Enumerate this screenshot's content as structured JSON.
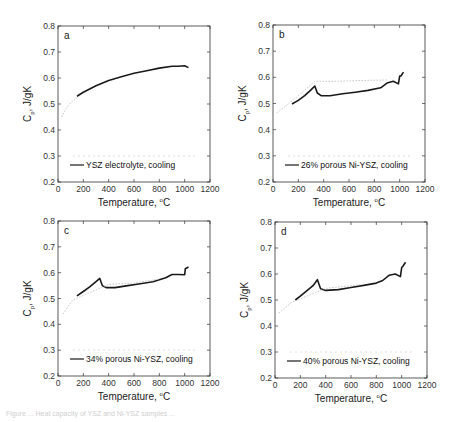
{
  "figure": {
    "caption": "Figure ... Heat capacity of YSZ and Ni-YSZ samples ..."
  },
  "chart_data": [
    {
      "type": "line",
      "panel": "a",
      "title": "",
      "xlabel": "Temperature, °C",
      "ylabel": "Cp, J/gK",
      "xlim": [
        0,
        1200
      ],
      "ylim": [
        0.2,
        0.8
      ],
      "xticks": [
        0,
        200,
        400,
        600,
        800,
        1000,
        1200
      ],
      "yticks": [
        0.2,
        0.3,
        0.4,
        0.5,
        0.6,
        0.7,
        0.8
      ],
      "legend": [
        "YSZ electrolyte, cooling"
      ],
      "legend_position": "lower center",
      "grid": false,
      "series": [
        {
          "name": "YSZ electrolyte, cooling",
          "x": [
            150,
            200,
            300,
            400,
            500,
            600,
            700,
            800,
            900,
            950,
            1000,
            1030
          ],
          "y": [
            0.53,
            0.545,
            0.57,
            0.59,
            0.605,
            0.618,
            0.628,
            0.638,
            0.645,
            0.645,
            0.647,
            0.64
          ]
        },
        {
          "name": "heating (faint)",
          "x": [
            30,
            60,
            100,
            150
          ],
          "y": [
            0.45,
            0.48,
            0.505,
            0.525
          ]
        }
      ]
    },
    {
      "type": "line",
      "panel": "b",
      "xlabel": "Temperature, °C",
      "ylabel": "Cp, J/gK",
      "xlim": [
        0,
        1200
      ],
      "ylim": [
        0.2,
        0.8
      ],
      "xticks": [
        0,
        200,
        400,
        600,
        800,
        1000,
        1200
      ],
      "yticks": [
        0.2,
        0.3,
        0.4,
        0.5,
        0.6,
        0.7,
        0.8
      ],
      "legend": [
        "26% porous Ni-YSZ, cooling"
      ],
      "legend_position": "lower center",
      "grid": false,
      "series": [
        {
          "name": "26% porous Ni-YSZ, cooling",
          "x": [
            150,
            200,
            250,
            300,
            330,
            350,
            380,
            450,
            550,
            650,
            750,
            850,
            900,
            950,
            990,
            1000,
            1010,
            1030
          ],
          "y": [
            0.498,
            0.512,
            0.53,
            0.552,
            0.567,
            0.54,
            0.53,
            0.53,
            0.537,
            0.543,
            0.55,
            0.56,
            0.578,
            0.585,
            0.575,
            0.605,
            0.605,
            0.62
          ]
        },
        {
          "name": "heating (faint)",
          "x": [
            30,
            100,
            200,
            330,
            500,
            700,
            900
          ],
          "y": [
            0.465,
            0.49,
            0.53,
            0.585,
            0.585,
            0.588,
            0.59
          ]
        }
      ]
    },
    {
      "type": "line",
      "panel": "c",
      "xlabel": "Temperature, °C",
      "ylabel": "Cp, J/gK",
      "xlim": [
        0,
        1200
      ],
      "ylim": [
        0.2,
        0.8
      ],
      "xticks": [
        0,
        200,
        400,
        600,
        800,
        1000,
        1200
      ],
      "yticks": [
        0.2,
        0.3,
        0.4,
        0.5,
        0.6,
        0.7,
        0.8
      ],
      "legend": [
        "34% porous Ni-YSZ, cooling"
      ],
      "legend_position": "lower center",
      "grid": false,
      "series": [
        {
          "name": "34% porous Ni-YSZ, cooling",
          "x": [
            150,
            200,
            250,
            300,
            330,
            350,
            380,
            450,
            550,
            650,
            750,
            850,
            900,
            950,
            1000,
            1005,
            1030
          ],
          "y": [
            0.51,
            0.527,
            0.545,
            0.565,
            0.578,
            0.55,
            0.542,
            0.542,
            0.55,
            0.557,
            0.565,
            0.58,
            0.593,
            0.593,
            0.592,
            0.615,
            0.622
          ]
        },
        {
          "name": "heating (faint)",
          "x": [
            40,
            80,
            120,
            400,
            600,
            800
          ],
          "y": [
            0.44,
            0.47,
            0.495,
            0.555,
            0.56,
            0.575
          ]
        }
      ]
    },
    {
      "type": "line",
      "panel": "d",
      "xlabel": "Temperature, °C",
      "ylabel": "Cp, J/gK",
      "xlim": [
        0,
        1200
      ],
      "ylim": [
        0.2,
        0.8
      ],
      "xticks": [
        0,
        200,
        400,
        600,
        800,
        1000,
        1200
      ],
      "yticks": [
        0.2,
        0.3,
        0.4,
        0.5,
        0.6,
        0.7,
        0.8
      ],
      "legend": [
        "40% porous Ni-YSZ, cooling"
      ],
      "legend_position": "lower center",
      "grid": false,
      "series": [
        {
          "name": "40% porous Ni-YSZ, cooling",
          "x": [
            160,
            200,
            250,
            300,
            335,
            360,
            400,
            500,
            600,
            700,
            800,
            850,
            900,
            950,
            990,
            1000,
            1010,
            1030
          ],
          "y": [
            0.5,
            0.515,
            0.535,
            0.555,
            0.578,
            0.543,
            0.537,
            0.54,
            0.548,
            0.556,
            0.565,
            0.575,
            0.595,
            0.6,
            0.59,
            0.625,
            0.63,
            0.645
          ]
        },
        {
          "name": "heating (faint)",
          "x": [
            30,
            80,
            130,
            400,
            700
          ],
          "y": [
            0.45,
            0.47,
            0.49,
            0.545,
            0.56
          ]
        }
      ]
    }
  ],
  "panels": [
    {
      "letter": "a",
      "legend": "YSZ electrolyte, cooling"
    },
    {
      "letter": "b",
      "legend": "26% porous Ni-YSZ, cooling"
    },
    {
      "letter": "c",
      "legend": "34% porous Ni-YSZ, cooling"
    },
    {
      "letter": "d",
      "legend": "40% porous Ni-YSZ, cooling"
    }
  ],
  "axes": {
    "xlabel": "Temperature, ",
    "xunit": "C",
    "xdeg": "o",
    "ylabel_main": "C",
    "ylabel_sub": "p",
    "ylabel_rest": ", J/gK",
    "xticks": [
      "0",
      "200",
      "400",
      "600",
      "800",
      "1000",
      "1200"
    ],
    "yticks": [
      "0.2",
      "0.3",
      "0.4",
      "0.5",
      "0.6",
      "0.7",
      "0.8"
    ]
  },
  "colors": {
    "line": "#1a1a1a",
    "faint": "#b8b8b8",
    "axis": "#333333"
  }
}
